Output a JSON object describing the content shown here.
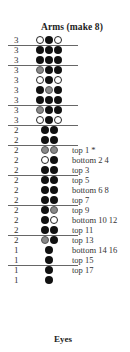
{
  "title": "Arms (make 8)",
  "colors": {
    "black": "#111111",
    "grey": "#888888",
    "white": "#ffffff",
    "separator": "#666666"
  },
  "rows": [
    {
      "count": "3",
      "beads": [
        "white",
        "black",
        "white"
      ],
      "note": "",
      "sep": true
    },
    {
      "count": "3",
      "beads": [
        "black",
        "black",
        "black"
      ],
      "note": "",
      "sep": false
    },
    {
      "count": "3",
      "beads": [
        "black",
        "black",
        "black"
      ],
      "note": "",
      "sep": true
    },
    {
      "count": "3",
      "beads": [
        "grey",
        "black",
        "black"
      ],
      "note": "",
      "sep": false
    },
    {
      "count": "3",
      "beads": [
        "white",
        "black",
        "white"
      ],
      "note": "",
      "sep": false
    },
    {
      "count": "3",
      "beads": [
        "black",
        "grey",
        "black"
      ],
      "note": "",
      "sep": false
    },
    {
      "count": "3",
      "beads": [
        "black",
        "black",
        "black"
      ],
      "note": "",
      "sep": true
    },
    {
      "count": "3",
      "beads": [
        "grey",
        "black",
        "black"
      ],
      "note": "",
      "sep": false
    },
    {
      "count": "3",
      "beads": [
        "white",
        "black",
        "white"
      ],
      "note": "",
      "sep": true
    },
    {
      "count": "2",
      "beads": [
        "black",
        "black"
      ],
      "note": "",
      "sep": false
    },
    {
      "count": "2",
      "beads": [
        "black",
        "black"
      ],
      "note": "",
      "sep": true
    },
    {
      "count": "2",
      "beads": [
        "grey",
        "grey"
      ],
      "note": "top  1  *",
      "sep": false
    },
    {
      "count": "2",
      "beads": [
        "white",
        "black"
      ],
      "note": "bottom 2 4",
      "sep": false
    },
    {
      "count": "2",
      "beads": [
        "black",
        "black"
      ],
      "note": "top  3",
      "sep": true
    },
    {
      "count": "2",
      "beads": [
        "black",
        "black"
      ],
      "note": "top  5",
      "sep": false
    },
    {
      "count": "2",
      "beads": [
        "black",
        "black"
      ],
      "note": "bottom 6 8",
      "sep": false
    },
    {
      "count": "2",
      "beads": [
        "black",
        "black"
      ],
      "note": "top  7",
      "sep": true
    },
    {
      "count": "2",
      "beads": [
        "black",
        "grey"
      ],
      "note": "top  9",
      "sep": false
    },
    {
      "count": "2",
      "beads": [
        "black",
        "white"
      ],
      "note": "bottom 10 12",
      "sep": false
    },
    {
      "count": "2",
      "beads": [
        "black",
        "black"
      ],
      "note": "top  11",
      "sep": true
    },
    {
      "count": "2",
      "beads": [
        "grey",
        "black"
      ],
      "note": "top  13",
      "sep": false
    },
    {
      "count": "1",
      "beads": [
        "black"
      ],
      "note": "bottom 14 16",
      "sep": false
    },
    {
      "count": "1",
      "beads": [
        "black"
      ],
      "note": "top  15",
      "sep": true
    },
    {
      "count": "1",
      "beads": [
        "black"
      ],
      "note": "top  17",
      "sep": false
    },
    {
      "count": "1",
      "beads": [
        "black"
      ],
      "note": "",
      "sep": false
    }
  ],
  "eyes_title": "Eyes"
}
